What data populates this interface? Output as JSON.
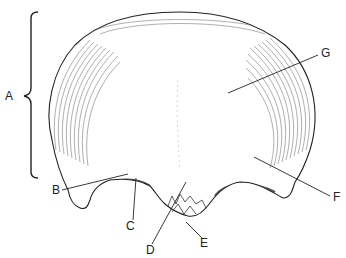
{
  "diagram": {
    "labels": [
      {
        "id": "A",
        "text": "A",
        "x": 5,
        "y": 90
      },
      {
        "id": "B",
        "text": "B",
        "x": 52,
        "y": 184
      },
      {
        "id": "C",
        "text": "C",
        "x": 126,
        "y": 220
      },
      {
        "id": "D",
        "text": "D",
        "x": 146,
        "y": 244
      },
      {
        "id": "E",
        "text": "E",
        "x": 200,
        "y": 237
      },
      {
        "id": "F",
        "text": "F",
        "x": 333,
        "y": 191
      },
      {
        "id": "G",
        "text": "G",
        "x": 321,
        "y": 47
      }
    ],
    "colors": {
      "ink": "#222222",
      "background": "#ffffff"
    }
  }
}
